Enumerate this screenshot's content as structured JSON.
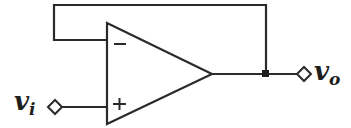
{
  "diagram": {
    "type": "op-amp voltage follower (unity-gain buffer)",
    "input_label": {
      "main": "v",
      "sub": "i"
    },
    "output_label": {
      "main": "v",
      "sub": "o"
    },
    "inverting_sign": "−",
    "noninverting_sign": "+",
    "colors": {
      "line": "#2a2a2a",
      "background": "#ffffff"
    }
  }
}
